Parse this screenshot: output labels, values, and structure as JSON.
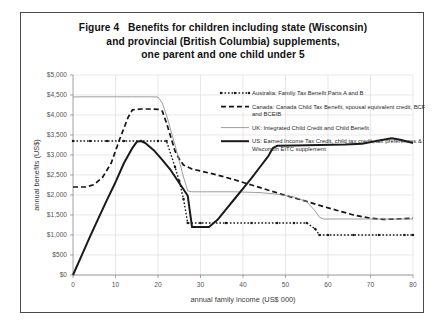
{
  "figure": {
    "title_lines": [
      "Figure 4   Benefits for children including state (Wisconsin)",
      "and provincial (British Columbia) supplements,",
      "one parent and one child under 5"
    ],
    "border_color": "#4a4a4a"
  },
  "chart_data": {
    "type": "line",
    "title": "Figure 4   Benefits for children including state (Wisconsin) and provincial (British Columbia) supplements, one parent and one child under 5",
    "xlabel": "annual family income (US$ 000)",
    "ylabel": "annual benefits (US$)",
    "xlim": [
      0,
      80
    ],
    "ylim": [
      0,
      5000
    ],
    "xticks": [
      0,
      10,
      20,
      30,
      40,
      50,
      60,
      70,
      80
    ],
    "xtick_labels": [
      "0",
      "10",
      "20",
      "30",
      "40",
      "50",
      "60",
      "70",
      "80"
    ],
    "yticks": [
      0,
      500,
      1000,
      1500,
      2000,
      2500,
      3000,
      3500,
      4000,
      4500,
      5000
    ],
    "ytick_labels": [
      "$0",
      "$500",
      "$1,000",
      "$1,500",
      "$2,000",
      "$2,500",
      "$3,000",
      "$3,500",
      "$4,000",
      "$4,500",
      "$5,000"
    ],
    "grid": true,
    "legend_position": "upper right inside plot",
    "series": [
      {
        "name": "Australia: Family Tax Benefit Parts A and B",
        "key": "australia",
        "style": "dotted-with-markers",
        "color": "#1a1a1a",
        "points": [
          [
            0,
            3350
          ],
          [
            4,
            3350
          ],
          [
            8,
            3350
          ],
          [
            12,
            3350
          ],
          [
            16,
            3350
          ],
          [
            20,
            3350
          ],
          [
            22,
            3350
          ],
          [
            24,
            2700
          ],
          [
            25,
            2350
          ],
          [
            26,
            1900
          ],
          [
            27,
            1300
          ],
          [
            30,
            1300
          ],
          [
            36,
            1300
          ],
          [
            42,
            1300
          ],
          [
            48,
            1300
          ],
          [
            52,
            1300
          ],
          [
            55,
            1300
          ],
          [
            57,
            1150
          ],
          [
            58,
            1000
          ],
          [
            60,
            1000
          ],
          [
            66,
            1000
          ],
          [
            72,
            1000
          ],
          [
            78,
            1000
          ],
          [
            80,
            1000
          ]
        ]
      },
      {
        "name": "Canada: Canada Child Tax Benefit, spousal equivalent credit, BCFB and BCEIB",
        "key": "canada",
        "style": "dashed",
        "color": "#141414",
        "points": [
          [
            0,
            2200
          ],
          [
            3,
            2200
          ],
          [
            5,
            2260
          ],
          [
            7,
            2450
          ],
          [
            9,
            2800
          ],
          [
            11,
            3400
          ],
          [
            13,
            3950
          ],
          [
            14,
            4130
          ],
          [
            16,
            4150
          ],
          [
            18,
            4150
          ],
          [
            20,
            4140
          ],
          [
            21,
            4100
          ],
          [
            22,
            3800
          ],
          [
            23,
            3450
          ],
          [
            24,
            3100
          ],
          [
            25,
            2900
          ],
          [
            26,
            2750
          ],
          [
            28,
            2650
          ],
          [
            30,
            2600
          ],
          [
            34,
            2500
          ],
          [
            38,
            2380
          ],
          [
            42,
            2250
          ],
          [
            46,
            2120
          ],
          [
            50,
            1990
          ],
          [
            54,
            1870
          ],
          [
            58,
            1740
          ],
          [
            62,
            1620
          ],
          [
            66,
            1500
          ],
          [
            70,
            1420
          ],
          [
            73,
            1390
          ],
          [
            76,
            1400
          ],
          [
            80,
            1420
          ]
        ]
      },
      {
        "name": "UK: Integrated Child Credit and Child Benefit",
        "key": "uk",
        "style": "thin-solid",
        "color": "#8c8c8c",
        "points": [
          [
            0,
            4450
          ],
          [
            2,
            4455
          ],
          [
            6,
            4455
          ],
          [
            10,
            4455
          ],
          [
            14,
            4455
          ],
          [
            18,
            4455
          ],
          [
            20,
            4450
          ],
          [
            21,
            4300
          ],
          [
            22,
            4000
          ],
          [
            23,
            3620
          ],
          [
            24,
            3250
          ],
          [
            25,
            2850
          ],
          [
            26,
            2450
          ],
          [
            27,
            2100
          ],
          [
            28,
            2080
          ],
          [
            32,
            2080
          ],
          [
            38,
            2080
          ],
          [
            44,
            2060
          ],
          [
            48,
            2020
          ],
          [
            52,
            1950
          ],
          [
            55,
            1830
          ],
          [
            57,
            1600
          ],
          [
            58,
            1440
          ],
          [
            59,
            1400
          ],
          [
            64,
            1400
          ],
          [
            70,
            1400
          ],
          [
            76,
            1400
          ],
          [
            80,
            1400
          ]
        ]
      },
      {
        "name": "US: Earned Income Tax Credit, child tax credit, tax preferences & Wisconsin EITC supplement",
        "key": "us",
        "style": "thick-solid",
        "color": "#1a1a1a",
        "points": [
          [
            0,
            0
          ],
          [
            2,
            480
          ],
          [
            4,
            960
          ],
          [
            6,
            1420
          ],
          [
            8,
            1880
          ],
          [
            10,
            2320
          ],
          [
            12,
            2800
          ],
          [
            14,
            3180
          ],
          [
            15,
            3330
          ],
          [
            16,
            3350
          ],
          [
            17,
            3300
          ],
          [
            19,
            3120
          ],
          [
            21,
            2880
          ],
          [
            23,
            2620
          ],
          [
            25,
            2300
          ],
          [
            27,
            1980
          ],
          [
            28,
            1200
          ],
          [
            30,
            1200
          ],
          [
            32,
            1200
          ],
          [
            34,
            1380
          ],
          [
            36,
            1640
          ],
          [
            38,
            1900
          ],
          [
            40,
            2160
          ],
          [
            42,
            2420
          ],
          [
            44,
            2700
          ],
          [
            46,
            2980
          ],
          [
            47,
            3170
          ],
          [
            48,
            3230
          ],
          [
            52,
            3240
          ],
          [
            58,
            3250
          ],
          [
            64,
            3260
          ],
          [
            68,
            3280
          ],
          [
            72,
            3360
          ],
          [
            75,
            3420
          ],
          [
            77,
            3380
          ],
          [
            80,
            3300
          ]
        ]
      }
    ],
    "legend_entries": [
      {
        "label_lines": [
          "Australia: Family Tax Benefit Parts A and B"
        ],
        "marker_style": "dotted-with-markers"
      },
      {
        "label_lines": [
          "Canada: Canada Child Tax Benefit, spousal equivalent credit, BCFB",
          "and BCEIB"
        ],
        "marker_style": "dashed"
      },
      {
        "label_lines": [
          "UK: Integrated Child Credit and Child Benefit"
        ],
        "marker_style": "thin-solid"
      },
      {
        "label_lines": [
          "US: Earned Income Tax Credit, child tax credit, tax preferences &",
          "Wisconsin EITC supplement"
        ],
        "marker_style": "thick-solid"
      }
    ]
  }
}
